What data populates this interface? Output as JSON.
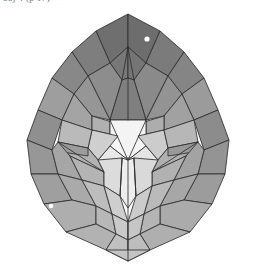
{
  "page": {
    "background_color": "#ffffff",
    "width": 255,
    "height": 272
  },
  "caption": {
    "text": "obj 4  (p 17)",
    "note": "partially cropped text fragment at top-left"
  },
  "figure": {
    "type": "3d-polyhedron-render",
    "outline_color": "#2e2e2e",
    "outline_width": 0.85,
    "bounds": {
      "left": 22,
      "right": 233,
      "top": 14,
      "bottom": 261
    },
    "palette": {
      "darkest": "#6d6d6d",
      "dark": "#7c7c7c",
      "mid_dark": "#8b8b8b",
      "mid": "#9a9a9a",
      "mid_light": "#a8a8a8",
      "light": "#b6b6b6",
      "lighter": "#c6c6c6",
      "pale": "#d6d6d6",
      "paler": "#e4e4e4",
      "near_white": "#f2f2f2",
      "white": "#fdfdfd"
    },
    "highlights": [
      {
        "name": "specular-highlight-upper-right",
        "cx": 147,
        "cy": 39,
        "r": 2.6,
        "color": "#ffffff"
      },
      {
        "name": "specular-highlight-lower-left",
        "cx": 51,
        "cy": 206,
        "r": 2.3,
        "color": "#ffffff"
      }
    ],
    "facets": [
      {
        "id": "apex-left-dark",
        "fill": "#6f6f6f",
        "points": "128,14 96,31 110,63 128,47"
      },
      {
        "id": "apex-right-dark",
        "fill": "#6d6d6d",
        "points": "128,14 160,31 146,63 128,47"
      },
      {
        "id": "apex-notch-left",
        "fill": "#787878",
        "points": "110,63 128,47 128,78 122,80"
      },
      {
        "id": "apex-notch-right",
        "fill": "#757575",
        "points": "146,63 128,47 128,78 134,80"
      },
      {
        "id": "crown-left-outer",
        "fill": "#7e7e7e",
        "points": "96,31 72,52 88,76 110,63"
      },
      {
        "id": "crown-right-outer",
        "fill": "#7b7b7b",
        "points": "160,31 184,52 168,76 146,63"
      },
      {
        "id": "crown-left-far",
        "fill": "#888888",
        "points": "72,52 52,78 74,94 88,76"
      },
      {
        "id": "crown-right-far",
        "fill": "#858585",
        "points": "184,52 204,78 182,94 168,76"
      },
      {
        "id": "v-wedge-left",
        "fill": "#8d8d8d",
        "points": "110,63 88,76 110,120 122,80"
      },
      {
        "id": "v-wedge-right",
        "fill": "#8a8a8a",
        "points": "146,63 168,76 146,120 134,80"
      },
      {
        "id": "v-wedge-center",
        "fill": "#7f7f7f",
        "points": "122,80 128,78 134,80 146,120 110,120"
      },
      {
        "id": "band-left-a",
        "fill": "#969696",
        "points": "88,76 74,94 92,116 110,120"
      },
      {
        "id": "band-right-a",
        "fill": "#939393",
        "points": "168,76 182,94 164,116 146,120"
      },
      {
        "id": "band-left-b",
        "fill": "#9e9e9e",
        "points": "52,78 38,110 62,120 74,94"
      },
      {
        "id": "band-right-b",
        "fill": "#9b9b9b",
        "points": "204,78 218,110 194,120 182,94"
      },
      {
        "id": "band-left-c",
        "fill": "#a4a4a4",
        "points": "74,94 62,120 92,130 92,116"
      },
      {
        "id": "band-right-c",
        "fill": "#a1a1a1",
        "points": "182,94 194,120 164,130 164,116"
      },
      {
        "id": "rim-left-upper",
        "fill": "#8f8f8f",
        "points": "38,110 27,140 52,150 62,120"
      },
      {
        "id": "rim-right-upper",
        "fill": "#8c8c8c",
        "points": "218,110 229,140 204,150 194,120"
      },
      {
        "id": "mid-left-pocket-top",
        "fill": "#b0b0b0",
        "points": "92,116 92,130 118,136 112,122"
      },
      {
        "id": "mid-right-pocket-top",
        "fill": "#adadad",
        "points": "164,116 164,130 138,136 144,122"
      },
      {
        "id": "mid-left-pocket-face",
        "fill": "#c2c2c2",
        "points": "110,120 112,122 118,136 128,142 110,146"
      },
      {
        "id": "mid-right-pocket-face",
        "fill": "#bfbfbf",
        "points": "146,120 144,122 138,136 128,142 146,146"
      },
      {
        "id": "center-bright-top",
        "fill": "#f4f4f4",
        "points": "110,120 146,120 146,146 128,160 110,146"
      },
      {
        "id": "center-bright-stem",
        "fill": "#ededed",
        "points": "122,158 134,158 136,196 128,208 120,196"
      },
      {
        "id": "center-bright-left",
        "fill": "#e8e8e8",
        "points": "110,146 128,160 122,158 104,172 98,160"
      },
      {
        "id": "center-bright-right",
        "fill": "#e5e5e5",
        "points": "146,146 128,160 134,158 152,172 158,160"
      },
      {
        "id": "inner-left-a",
        "fill": "#cfcfcf",
        "points": "92,130 118,136 110,146 98,160 88,148"
      },
      {
        "id": "inner-right-a",
        "fill": "#cccccc",
        "points": "164,130 138,136 146,146 158,160 168,148"
      },
      {
        "id": "inner-left-b",
        "fill": "#bababa",
        "points": "62,120 92,130 88,148 70,156 58,142"
      },
      {
        "id": "inner-right-b",
        "fill": "#b7b7b7",
        "points": "194,120 164,130 168,148 186,156 198,142"
      },
      {
        "id": "shelf-left",
        "fill": "#b3b3b3",
        "points": "58,142 70,156 104,172 98,160 88,148"
      },
      {
        "id": "shelf-right",
        "fill": "#b0b0b0",
        "points": "198,142 186,156 152,172 158,160 168,148"
      },
      {
        "id": "shelf-left-edge",
        "fill": "#9c9c9c",
        "points": "58,142 88,148 88,156 62,152"
      },
      {
        "id": "shelf-right-edge",
        "fill": "#999999",
        "points": "198,142 168,148 168,156 194,152"
      },
      {
        "id": "rim-left-mid",
        "fill": "#979797",
        "points": "27,140 31,174 58,174 52,150"
      },
      {
        "id": "rim-right-mid",
        "fill": "#949494",
        "points": "229,140 225,174 198,174 204,150"
      },
      {
        "id": "mid-left-lower",
        "fill": "#a6a6a6",
        "points": "52,150 58,174 82,180 70,156 58,142"
      },
      {
        "id": "mid-right-lower",
        "fill": "#a3a3a3",
        "points": "204,150 198,174 174,180 186,156 198,142"
      },
      {
        "id": "low-left-a",
        "fill": "#b4b4b4",
        "points": "70,156 82,180 104,186 104,172"
      },
      {
        "id": "low-right-a",
        "fill": "#b1b1b1",
        "points": "186,156 174,180 152,186 152,172"
      },
      {
        "id": "low-center-left",
        "fill": "#dcdcdc",
        "points": "104,172 104,186 120,196 122,158 98,160"
      },
      {
        "id": "low-center-right",
        "fill": "#d9d9d9",
        "points": "152,172 152,186 136,196 134,158 158,160"
      },
      {
        "id": "rim-left-low",
        "fill": "#9f9f9f",
        "points": "31,174 44,204 72,200 58,174"
      },
      {
        "id": "rim-right-low",
        "fill": "#9c9c9c",
        "points": "225,174 212,204 184,200 198,174"
      },
      {
        "id": "low-left-b",
        "fill": "#aaaaaa",
        "points": "58,174 72,200 96,206 82,180"
      },
      {
        "id": "low-right-b",
        "fill": "#a7a7a7",
        "points": "198,174 184,200 160,206 174,180"
      },
      {
        "id": "low-left-c",
        "fill": "#bdbdbd",
        "points": "82,180 96,206 112,214 104,186"
      },
      {
        "id": "low-right-c",
        "fill": "#bababa",
        "points": "174,180 160,206 144,214 152,186"
      },
      {
        "id": "low-center-panel-l",
        "fill": "#cecece",
        "points": "104,186 112,214 128,222 120,196"
      },
      {
        "id": "low-center-panel-r",
        "fill": "#cbcbcb",
        "points": "152,186 144,214 128,222 136,196"
      },
      {
        "id": "base-left-a",
        "fill": "#aeaeae",
        "points": "44,204 66,232 96,224 96,206 72,200"
      },
      {
        "id": "base-right-a",
        "fill": "#ababab",
        "points": "212,204 190,232 160,224 160,206 184,200"
      },
      {
        "id": "base-left-b",
        "fill": "#b8b8b8",
        "points": "96,206 96,224 116,234 112,214"
      },
      {
        "id": "base-right-b",
        "fill": "#b5b5b5",
        "points": "160,206 160,224 140,234 144,214"
      },
      {
        "id": "base-center-l",
        "fill": "#c9c9c9",
        "points": "112,214 116,234 128,240 128,222"
      },
      {
        "id": "base-center-r",
        "fill": "#c6c6c6",
        "points": "144,214 140,234 128,240 128,222"
      },
      {
        "id": "foot-left",
        "fill": "#b2b2b2",
        "points": "66,232 106,250 116,234 96,224"
      },
      {
        "id": "foot-right",
        "fill": "#afafaf",
        "points": "190,232 150,250 140,234 160,224"
      },
      {
        "id": "foot-center-l",
        "fill": "#c0c0c0",
        "points": "116,234 106,250 128,261 128,240"
      },
      {
        "id": "foot-center-r",
        "fill": "#bdbdbd",
        "points": "140,234 150,250 128,261 128,240"
      },
      {
        "id": "foot-center-base",
        "fill": "#c4c4c4",
        "points": "106,250 150,250 128,261"
      }
    ],
    "extra_edges": [
      {
        "name": "crease-apex-v-left",
        "x1": 128,
        "y1": 47,
        "x2": 122,
        "y2": 80
      },
      {
        "name": "crease-apex-v-right",
        "x1": 128,
        "y1": 47,
        "x2": 134,
        "y2": 80
      },
      {
        "name": "crease-spine-upper",
        "x1": 128,
        "y1": 78,
        "x2": 128,
        "y2": 120
      },
      {
        "name": "crease-center-left",
        "x1": 110,
        "y1": 120,
        "x2": 128,
        "y2": 160
      },
      {
        "name": "crease-center-right",
        "x1": 146,
        "y1": 120,
        "x2": 128,
        "y2": 160
      },
      {
        "name": "crease-spine-lower",
        "x1": 128,
        "y1": 160,
        "x2": 128,
        "y2": 261
      },
      {
        "name": "crease-stem-left",
        "x1": 122,
        "y1": 158,
        "x2": 120,
        "y2": 196
      },
      {
        "name": "crease-stem-right",
        "x1": 134,
        "y1": 158,
        "x2": 136,
        "y2": 196
      },
      {
        "name": "crease-arm-left",
        "x1": 104,
        "y1": 172,
        "x2": 58,
        "y2": 142
      },
      {
        "name": "crease-arm-right",
        "x1": 152,
        "y1": 172,
        "x2": 198,
        "y2": 142
      }
    ]
  }
}
